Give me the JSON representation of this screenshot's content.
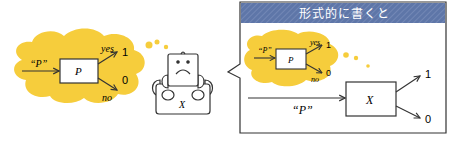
{
  "left_thought": {
    "input_label": "“P”",
    "box_label": "P",
    "yes_label": "yes",
    "no_label": "no",
    "out_yes": "1",
    "out_no": "0"
  },
  "robot": {
    "label": "X",
    "expression": "sad"
  },
  "panel": {
    "title": "形式的に書くと",
    "inner_thought": {
      "input_label": "“P”",
      "box_label": "P",
      "yes_label": "yes",
      "no_label": "no",
      "out_yes": "1",
      "out_no": "0"
    },
    "machine": {
      "input_label": "“P”",
      "box_label": "X",
      "out_top": "1",
      "out_bottom": "0"
    }
  },
  "colors": {
    "thought_yellow": "#f6cd3c",
    "banner_blue": "#5e76a8",
    "line": "#333333"
  }
}
